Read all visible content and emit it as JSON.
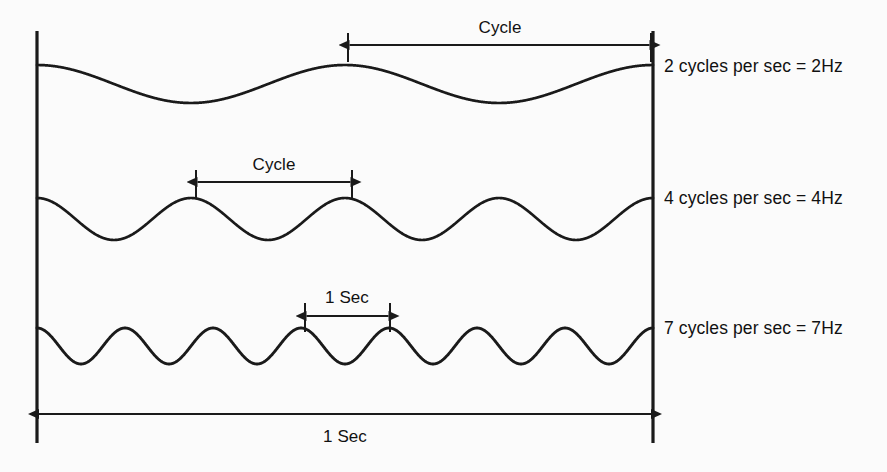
{
  "diagram": {
    "background_color": "#fbfbfb",
    "stroke_color": "#1a1a1a",
    "axis": {
      "left_bar_x": 37,
      "right_bar_x": 653,
      "top_y": 31,
      "bottom_y": 443,
      "span_label": "1 Sec",
      "span_label_x": 345,
      "span_label_y": 427,
      "arrow_y": 414
    },
    "waves": [
      {
        "id": "wave-2hz",
        "cycles": 2,
        "label": "2 cycles per sec = 2Hz",
        "label_x": 664,
        "label_y": 56,
        "baseline_y": 84,
        "amplitude": 19,
        "peak_y": 65,
        "trough_y": 103,
        "annotation": {
          "text": "Cycle",
          "text_x": 500,
          "text_y": 18,
          "arrow_y": 45,
          "x_start": 348,
          "x_end": 651,
          "tick_top": 33,
          "tick_bottom": 62
        }
      },
      {
        "id": "wave-4hz",
        "cycles": 4,
        "label": "4 cycles per sec = 4Hz",
        "label_x": 664,
        "label_y": 188,
        "baseline_y": 219,
        "amplitude": 21,
        "peak_y": 198,
        "trough_y": 240,
        "annotation": {
          "text": "Cycle",
          "text_x": 274,
          "text_y": 155,
          "arrow_y": 182,
          "x_start": 196,
          "x_end": 352,
          "tick_top": 170,
          "tick_bottom": 199
        }
      },
      {
        "id": "wave-7hz",
        "cycles": 7,
        "label": "7 cycles per sec = 7Hz",
        "label_x": 664,
        "label_y": 318,
        "baseline_y": 346,
        "amplitude": 18,
        "peak_y": 328,
        "trough_y": 364,
        "annotation": {
          "text": "1 Sec",
          "text_x": 347,
          "text_y": 288,
          "arrow_y": 316,
          "x_start": 305,
          "x_end": 390,
          "tick_top": 303,
          "tick_bottom": 332
        }
      }
    ]
  }
}
